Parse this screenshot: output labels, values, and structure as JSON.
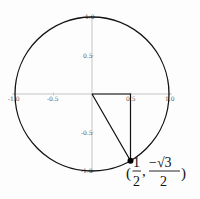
{
  "diagram": {
    "title": "",
    "type": "unit-circle",
    "axes": {
      "x_ticks": [
        "-1.0",
        "-0.5",
        "0.5",
        "1.0"
      ],
      "y_ticks": [
        "1.0",
        "0.5",
        "-0.5",
        "-1.0"
      ]
    },
    "point": {
      "x": 0.5,
      "y": -0.866,
      "label_open": "(",
      "label_x_num": "1",
      "label_x_den": "2",
      "label_comma": ",",
      "label_y_num": "−√3",
      "label_y_den": "2",
      "label_close": ")"
    },
    "triangle": {
      "vertices": [
        "origin",
        "(0.5, 0)",
        "(0.5, −√3/2)"
      ]
    },
    "colors": {
      "circle": "#111111",
      "axes": "#b5b5b5",
      "triangle": "#111111",
      "point": "#000000"
    }
  }
}
